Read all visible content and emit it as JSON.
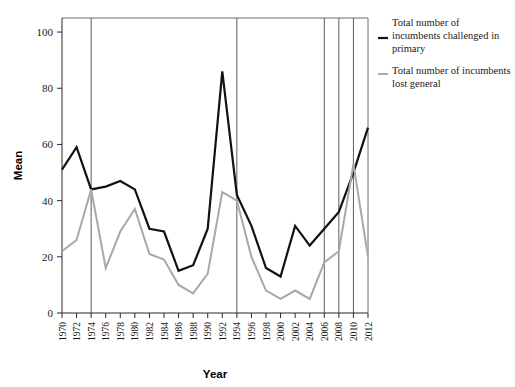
{
  "chart_data": {
    "type": "line",
    "title": "",
    "xlabel": "Year",
    "ylabel": "Mean",
    "ylim": [
      0,
      105
    ],
    "yticks": [
      0,
      20,
      40,
      60,
      80,
      100
    ],
    "grid": false,
    "legend_position": "right",
    "x": [
      1970,
      1972,
      1974,
      1976,
      1978,
      1980,
      1982,
      1984,
      1986,
      1988,
      1990,
      1992,
      1994,
      1996,
      1998,
      2000,
      2002,
      2004,
      2006,
      2008,
      2010,
      2012
    ],
    "categories": [
      "1970",
      "1972",
      "1974",
      "1976",
      "1978",
      "1980",
      "1982",
      "1984",
      "1986",
      "1988",
      "1990",
      "1992",
      "1994",
      "1996",
      "1998",
      "2000",
      "2002",
      "2004",
      "2006",
      "2008",
      "2010",
      "2012"
    ],
    "series": [
      {
        "name": "Total number of incumbents challenged in primary",
        "color": "#111111",
        "width": 2.2,
        "values": [
          51,
          59,
          44,
          45,
          47,
          44,
          30,
          29,
          15,
          17,
          30,
          86,
          42,
          31,
          16,
          13,
          31,
          24,
          30,
          36,
          50,
          66
        ]
      },
      {
        "name": "Total number of incumbents lost general",
        "color": "#a8a8a8",
        "width": 2.0,
        "values": [
          22,
          26,
          44,
          16,
          29,
          37,
          21,
          19,
          10,
          7,
          14,
          43,
          40,
          20,
          8,
          5,
          8,
          5,
          18,
          22,
          53,
          20
        ]
      }
    ],
    "reference_lines": [
      1974,
      1994,
      2006,
      2008,
      2010
    ]
  },
  "legend": {
    "entries": [
      {
        "label_lines": [
          "Total number of",
          "incumbents challenged in",
          "primary"
        ],
        "color": "#111111"
      },
      {
        "label_lines": [
          "Total number of incumbents",
          "lost general"
        ],
        "color": "#a8a8a8"
      }
    ]
  }
}
